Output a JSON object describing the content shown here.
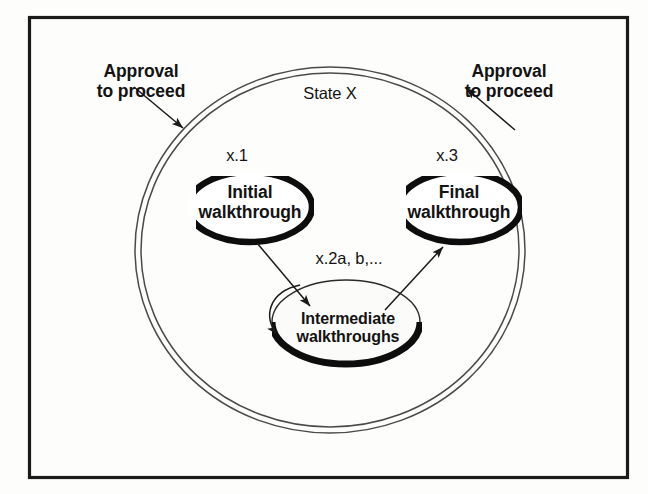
{
  "figure": {
    "frame": {
      "border_color": "#1a1a1a"
    },
    "container": {
      "label": "State X",
      "shape": "double-outline-ellipse",
      "outline_color": "#3a3a3a"
    },
    "annotations": [
      {
        "id": "approval-left",
        "label": "Approval\nto proceed",
        "arrow_direction": "inward"
      },
      {
        "id": "approval-right",
        "label": "Approval\nto proceed",
        "arrow_direction": "outward"
      }
    ],
    "nodes": [
      {
        "id": "initial",
        "step": "x.1",
        "label": "Initial\nwalkthrough",
        "shape": "crescent-shadow"
      },
      {
        "id": "intermediate",
        "step": "x.2a, b,...",
        "label": "Intermediate\nwalkthroughs",
        "shape": "ellipse-shadow"
      },
      {
        "id": "final",
        "step": "x.3",
        "label": "Final\nwalkthrough",
        "shape": "crescent-shadow"
      }
    ],
    "edges": [
      {
        "id": "initial-to-intermediate",
        "from": "initial",
        "to": "intermediate"
      },
      {
        "id": "intermediate-to-final",
        "from": "intermediate",
        "to": "final"
      },
      {
        "id": "intermediate-self-loop",
        "from": "intermediate",
        "to": "intermediate"
      }
    ]
  }
}
